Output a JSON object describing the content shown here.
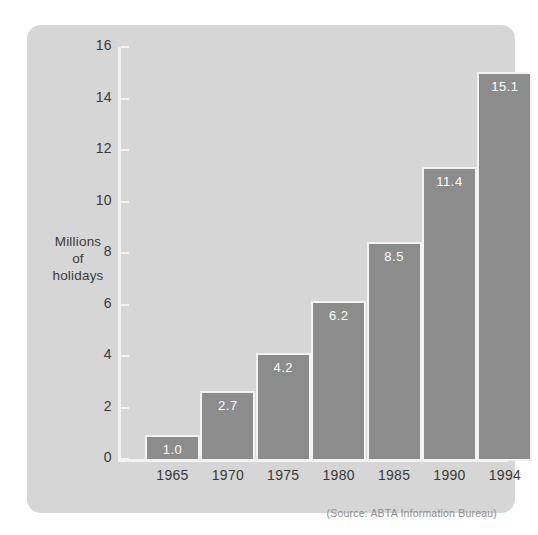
{
  "chart_data": {
    "type": "bar",
    "title": "",
    "xlabel": "",
    "ylabel": "Millions of holidays",
    "ylabel_lines": [
      "Millions",
      "of",
      "holidays"
    ],
    "categories": [
      "1965",
      "1970",
      "1975",
      "1980",
      "1985",
      "1990",
      "1994"
    ],
    "values": [
      1.0,
      2.7,
      4.2,
      6.2,
      8.5,
      11.4,
      15.1
    ],
    "value_labels": [
      "1.0",
      "2.7",
      "4.2",
      "6.2",
      "8.5",
      "11.4",
      "15.1"
    ],
    "ylim": [
      0,
      16
    ],
    "y_ticks": [
      0,
      2,
      4,
      6,
      8,
      10,
      12,
      14,
      16
    ],
    "y_tick_labels": [
      "0",
      "2",
      "4",
      "6",
      "8",
      "10",
      "12",
      "14",
      "16"
    ],
    "grid": false,
    "legend": false,
    "source_note": "(Source:  ABTA Information Bureau)",
    "colors": {
      "bar_fill": "#8b8c8b",
      "bar_border": "#f3f3f3",
      "panel_background": "#d5d6d5",
      "axis_line": "#f3f3f3",
      "tick_text": "#3a3a3a",
      "value_text": "#ffffff",
      "source_text": "#8d8e8d",
      "page_background": "#ffffff"
    }
  }
}
